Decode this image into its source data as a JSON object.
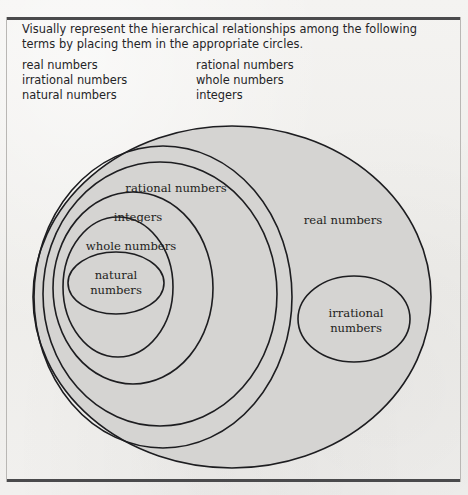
{
  "page": {
    "prompt": "Visually represent the hierarchical relationships among the following terms by placing them in the appropriate circles.",
    "background_color": "#f2f1ef",
    "rule_color": "#4a4a4c"
  },
  "term_list": {
    "rows": [
      {
        "left": "real numbers",
        "right": "rational numbers"
      },
      {
        "left": "irrational numbers",
        "right": "whole numbers"
      },
      {
        "left": "natural numbers",
        "right": "integers"
      }
    ]
  },
  "diagram": {
    "type": "euler-venn",
    "fill_color": "#d5d4d2",
    "stroke_color": "#1d1d20",
    "labels": {
      "real": "real numbers",
      "rational": "rational numbers",
      "integers": "integers",
      "whole": "whole numbers",
      "natural_line1": "natural",
      "natural_line2": "numbers",
      "irrational_line1": "irrational",
      "irrational_line2": "numbers"
    }
  }
}
